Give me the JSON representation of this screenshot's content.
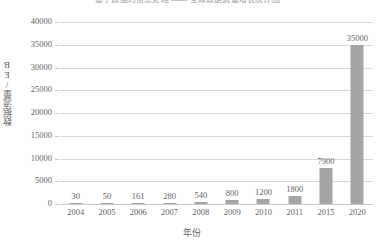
{
  "top_partial_title": "基于数据的信息处理 —— 全球数据流量增长统计图",
  "chart_data": {
    "type": "bar",
    "title": "",
    "xlabel": "年份",
    "ylabel": "数据流量/EB",
    "categories": [
      "2004",
      "2005",
      "2006",
      "2007",
      "2008",
      "2009",
      "2010",
      "2011",
      "2015",
      "2020"
    ],
    "values": [
      30,
      50,
      161,
      280,
      540,
      800,
      1200,
      1800,
      7900,
      35000
    ],
    "data_labels": [
      "30",
      "50",
      "161",
      "280",
      "540",
      "800",
      "1200",
      "1800",
      "7900",
      "35000"
    ],
    "ylim": [
      0,
      40000
    ],
    "ytick_values": [
      0,
      5000,
      10000,
      15000,
      20000,
      25000,
      30000,
      35000,
      40000
    ],
    "ytick_labels": [
      "0",
      "5000",
      "10000",
      "15000",
      "20000",
      "25000",
      "30000",
      "35000",
      "40000"
    ],
    "grid": true,
    "legend": false,
    "bar_color": "#A5A5A5",
    "gridline_color": "#D9D9D9",
    "background": "#FFFFFF"
  }
}
